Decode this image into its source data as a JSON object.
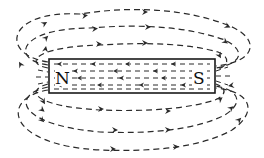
{
  "diagram": {
    "title": "",
    "magnet": {
      "north_label": "N",
      "south_label": "S",
      "internal_field_direction": "S to N (leftward)"
    },
    "external_field_direction": "N to S (rightward over and under the magnet)",
    "colors": {
      "line": "#2a2a2a",
      "magnet_outline": "#1a1a1a",
      "background": "#ffffff"
    }
  }
}
